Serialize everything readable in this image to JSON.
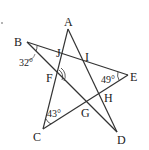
{
  "figure": {
    "type": "star-pentagram",
    "points": {
      "A": [
        68,
        29
      ],
      "B": [
        27,
        42
      ],
      "C": [
        43,
        129
      ],
      "D": [
        117,
        132
      ],
      "E": [
        128,
        75
      ]
    },
    "labels": [
      {
        "id": "A",
        "text": "A",
        "x": 64,
        "y": 26
      },
      {
        "id": "B",
        "text": "B",
        "x": 14,
        "y": 46
      },
      {
        "id": "J",
        "text": "J",
        "x": 56,
        "y": 57
      },
      {
        "id": "I",
        "text": "I",
        "x": 85,
        "y": 61
      },
      {
        "id": "E",
        "text": "E",
        "x": 130,
        "y": 81
      },
      {
        "id": "F",
        "text": "F",
        "x": 46,
        "y": 82
      },
      {
        "id": "H",
        "text": "H",
        "x": 104,
        "y": 102
      },
      {
        "id": "G",
        "text": "G",
        "x": 81,
        "y": 117
      },
      {
        "id": "C",
        "text": "C",
        "x": 33,
        "y": 141
      },
      {
        "id": "D",
        "text": "D",
        "x": 117,
        "y": 144
      }
    ],
    "angles": [
      {
        "vertex": "B",
        "text": "32°",
        "x": 19,
        "y": 66
      },
      {
        "vertex": "E",
        "text": "49°",
        "x": 101,
        "y": 83
      },
      {
        "vertex": "C",
        "text": "43°",
        "x": 47,
        "y": 117
      }
    ],
    "marked_angle": {
      "vertex": "F",
      "style": "double-arc"
    }
  }
}
